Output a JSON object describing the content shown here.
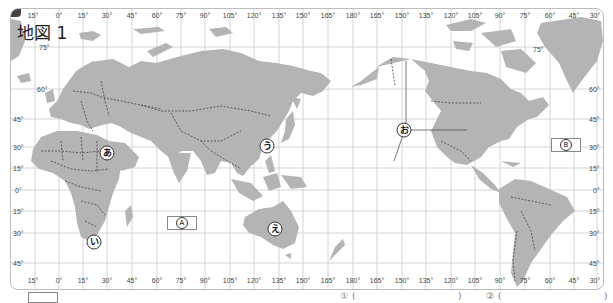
{
  "map": {
    "title": "地図 1",
    "longitude_labels_top": [
      "15°",
      "0°",
      "15°",
      "30°",
      "45°",
      "60°",
      "75°",
      "90°",
      "105°",
      "120°",
      "135°",
      "150°",
      "165°",
      "180°",
      "165°",
      "150°",
      "135°",
      "120°",
      "105°",
      "90°",
      "75°",
      "60°",
      "45°",
      "30°"
    ],
    "longitude_labels_bottom": [
      "15°",
      "0°",
      "15°",
      "30°",
      "45°",
      "60°",
      "75°",
      "90°",
      "105°",
      "120°",
      "135°",
      "150°",
      "165°",
      "180°",
      "165°",
      "150°",
      "135°",
      "120°",
      "105°",
      "90°",
      "75°",
      "60°",
      "45°",
      "30°"
    ],
    "latitude_labels_left": [
      "75°",
      "60°",
      "45°",
      "30°",
      "15°",
      "0°",
      "15°",
      "30°",
      "45°"
    ],
    "latitude_labels_right": [
      "75°",
      "60°",
      "45°",
      "30°",
      "15°",
      "0°",
      "15°",
      "30°",
      "45°"
    ],
    "markers": [
      {
        "id": "a",
        "label": "あ",
        "desc": "Egypt / Red Sea"
      },
      {
        "id": "i",
        "label": "い",
        "desc": "Southern Africa"
      },
      {
        "id": "u",
        "label": "う",
        "desc": "Japan area"
      },
      {
        "id": "e",
        "label": "え",
        "desc": "Australia"
      },
      {
        "id": "o",
        "label": "お",
        "desc": "North Pacific / North America lines"
      }
    ],
    "ocean_boxes": [
      {
        "id": "A",
        "label": "Ⓐ"
      },
      {
        "id": "B",
        "label": "Ⓑ"
      }
    ],
    "colors": {
      "land": "#b4b4b4",
      "grid": "#cfcfcf",
      "border": "#444444",
      "frame": "#bdbdbd"
    }
  },
  "question_strip": {
    "fragments": [
      "(",
      ")",
      "(",
      ")"
    ],
    "marks": [
      "①",
      "②"
    ]
  }
}
